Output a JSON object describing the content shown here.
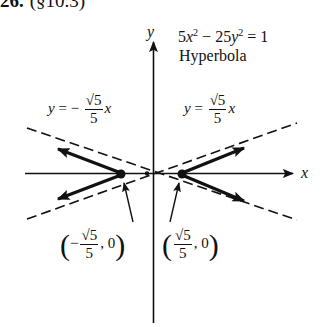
{
  "header": {
    "number": "26.",
    "section": "(§10.3)"
  },
  "figure": {
    "equation": {
      "coef_x": "5",
      "var_x": "x",
      "exp_x": "2",
      "minus": "−",
      "coef_y": "25",
      "var_y": "y",
      "exp_y": "2",
      "equals": "=",
      "rhs": "1"
    },
    "curve_type": "Hyperbola",
    "axes": {
      "x_label": "x",
      "y_label": "y"
    },
    "asymptotes": {
      "negative": {
        "lhs": "y",
        "eq": "= −",
        "num": "√5",
        "den": "5",
        "var": "x"
      },
      "positive": {
        "lhs": "y",
        "eq": "=",
        "num": "√5",
        "den": "5",
        "var": "x"
      }
    },
    "vertices": {
      "left": {
        "open": "(",
        "sign": "−",
        "num": "√5",
        "den": "5",
        "rest": ", 0",
        "close": ")"
      },
      "right": {
        "open": "(",
        "num": "√5",
        "den": "5",
        "rest": ", 0",
        "close": ")"
      }
    },
    "colors": {
      "ink": "#111111",
      "background": "#ffffff"
    }
  }
}
